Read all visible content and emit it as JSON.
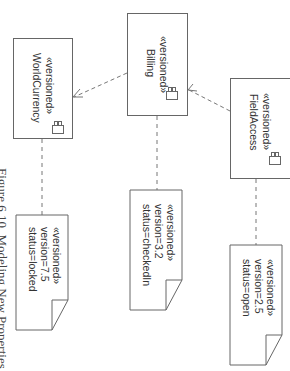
{
  "diagram": {
    "type": "UML component diagram (rotated 90°)",
    "caption": "Figure 6.10. Modeling New Properties",
    "components": [
      {
        "id": "world_currency",
        "stereotype": "«versioned»",
        "name": "WorldCurrency",
        "icon": "component-icon"
      },
      {
        "id": "billing",
        "stereotype": "«versioned»",
        "name": "Billing",
        "icon": "component-icon"
      },
      {
        "id": "field_access",
        "stereotype": "«versioned»",
        "name": "FieldAccess",
        "icon": "component-icon"
      }
    ],
    "notes": [
      {
        "attached_to": "world_currency",
        "stereotype": "«versioned»",
        "version": "version=7.5",
        "status": "status=locked"
      },
      {
        "attached_to": "billing",
        "stereotype": "«versioned»",
        "version": "version=3.2",
        "status": "status=checkedIn"
      },
      {
        "attached_to": "field_access",
        "stereotype": "«versioned»",
        "version": "version=2.5",
        "status": "status=open"
      }
    ],
    "dependencies": [
      {
        "from": "billing",
        "to": "world_currency",
        "style": "dashed-arrow"
      },
      {
        "from": "field_access",
        "to": "billing",
        "style": "dashed-arrow"
      }
    ],
    "colors": {
      "line": "#666666",
      "text": "#333333",
      "background": "#ffffff"
    }
  }
}
